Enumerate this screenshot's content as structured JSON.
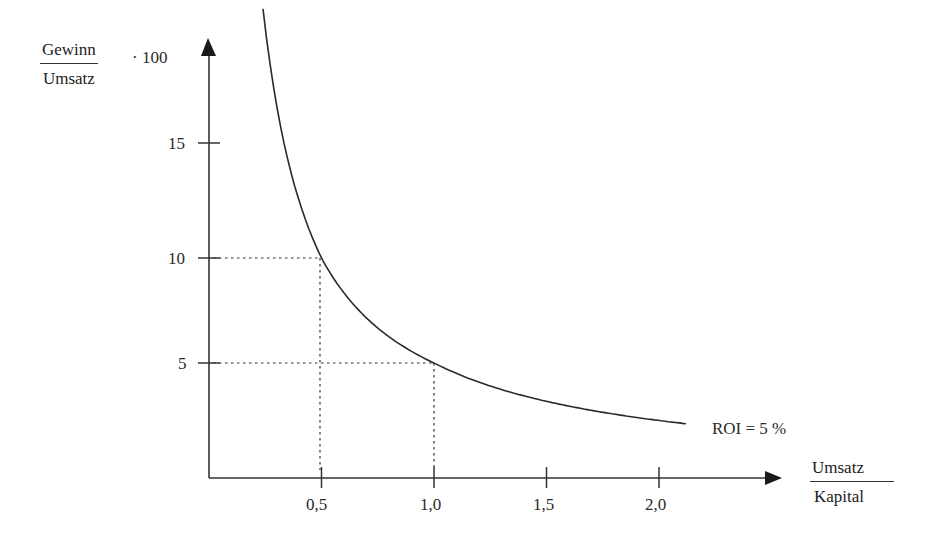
{
  "chart_data": {
    "type": "line",
    "title": "",
    "xlabel": {
      "numerator": "Umsatz",
      "denominator": "Kapital"
    },
    "ylabel": {
      "numerator": "Gewinn",
      "denominator": "Umsatz",
      "multiplier": "· 100"
    },
    "x_ticks": [
      {
        "label": "0,5",
        "value": 0.5
      },
      {
        "label": "1,0",
        "value": 1.0
      },
      {
        "label": "1,5",
        "value": 1.5
      },
      {
        "label": "2,0",
        "value": 2.0
      }
    ],
    "y_ticks": [
      {
        "label": "5",
        "value": 5
      },
      {
        "label": "10",
        "value": 10
      },
      {
        "label": "15",
        "value": 15
      }
    ],
    "xlim": [
      0,
      2.55
    ],
    "ylim": [
      0,
      19.5
    ],
    "grid": false,
    "series": [
      {
        "name": "ROI = 5 %",
        "formula": "y = 5 / x",
        "x": [
          0.24,
          0.3,
          0.4,
          0.5,
          0.6,
          0.75,
          1.0,
          1.25,
          1.5,
          1.75,
          2.0,
          2.12
        ],
        "y": [
          20.8,
          16.7,
          12.5,
          10.0,
          8.3,
          6.7,
          5.0,
          4.0,
          3.3,
          2.9,
          2.5,
          2.36
        ]
      }
    ],
    "annotations": [
      {
        "type": "dotted-guide",
        "x": 0.5,
        "y": 10
      },
      {
        "type": "dotted-guide",
        "x": 1.0,
        "y": 5
      },
      {
        "type": "curve-label",
        "text": "ROI = 5 %"
      }
    ]
  },
  "labels": {
    "y_num": "Gewinn",
    "y_den": "Umsatz",
    "y_mult": "· 100",
    "x_num": "Umsatz",
    "x_den": "Kapital",
    "curve": "ROI = 5 %",
    "x_ticks": [
      "0,5",
      "1,0",
      "1,5",
      "2,0"
    ],
    "y_ticks": [
      "5",
      "10",
      "15"
    ]
  }
}
